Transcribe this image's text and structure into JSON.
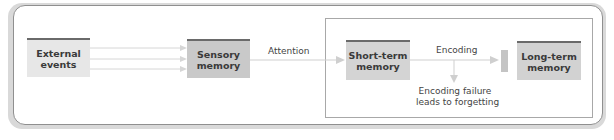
{
  "diagram": {
    "colors": {
      "external_box": "#e7e7e7",
      "sensory_box": "#c9c9c9",
      "short_term_box": "#d4d4d4",
      "long_term_box": "#d2d2d2",
      "box_top_border": "#6a6a6a",
      "arrow": "#cfcfcf",
      "frame": "#8f8f8f"
    },
    "nodes": [
      {
        "id": "external",
        "line1": "External",
        "line2": "events"
      },
      {
        "id": "sensory",
        "line1": "Sensory",
        "line2": "memory"
      },
      {
        "id": "short_term",
        "line1": "Short-term",
        "line2": "memory"
      },
      {
        "id": "long_term",
        "line1": "Long-term",
        "line2": "memory"
      }
    ],
    "edges": [
      {
        "from": "external",
        "to": "sensory",
        "label": "",
        "count": 3
      },
      {
        "from": "sensory",
        "to": "short_term",
        "label": "Attention"
      },
      {
        "from": "short_term",
        "to": "long_term",
        "label": "Encoding"
      },
      {
        "from": "short_term",
        "to": "forgetting",
        "label": ""
      }
    ],
    "forgetting_note": {
      "line1": "Encoding failure",
      "line2": "leads to forgetting"
    }
  }
}
